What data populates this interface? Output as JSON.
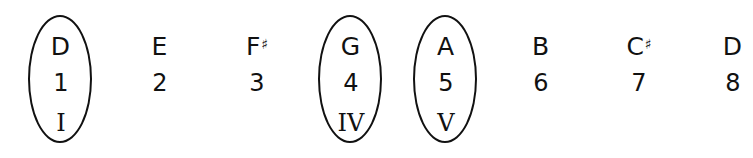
{
  "scale": [
    {
      "note": "D",
      "accidental": "",
      "degree": "1",
      "roman": "I",
      "circled": true
    },
    {
      "note": "E",
      "accidental": "",
      "degree": "2",
      "roman": "",
      "circled": false
    },
    {
      "note": "F",
      "accidental": "♯",
      "degree": "3",
      "roman": "",
      "circled": false
    },
    {
      "note": "G",
      "accidental": "",
      "degree": "4",
      "roman": "IV",
      "circled": true
    },
    {
      "note": "A",
      "accidental": "",
      "degree": "5",
      "roman": "V",
      "circled": true
    },
    {
      "note": "B",
      "accidental": "",
      "degree": "6",
      "roman": "",
      "circled": false
    },
    {
      "note": "C",
      "accidental": "♯",
      "degree": "7",
      "roman": "",
      "circled": false
    },
    {
      "note": "D",
      "accidental": "",
      "degree": "8",
      "roman": "",
      "circled": false
    }
  ]
}
